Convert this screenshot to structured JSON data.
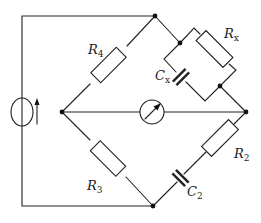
{
  "diagram": {
    "type": "ac-bridge-circuit",
    "components": [
      {
        "id": "R4",
        "kind": "resistor",
        "label": "R",
        "subscript": "4",
        "branch": "left-node to top-node"
      },
      {
        "id": "Rx",
        "kind": "resistor",
        "label": "R",
        "subscript": "x",
        "branch": "top-node to right-node (parallel with Cx)"
      },
      {
        "id": "Cx",
        "kind": "capacitor",
        "label": "C",
        "subscript": "x",
        "branch": "top-node to right-node (parallel with Rx)"
      },
      {
        "id": "R3",
        "kind": "resistor",
        "label": "R",
        "subscript": "3",
        "branch": "left-node to bottom-node"
      },
      {
        "id": "R2",
        "kind": "resistor",
        "label": "R",
        "subscript": "2",
        "branch": "right-node to bottom-node (series with C2)"
      },
      {
        "id": "C2",
        "kind": "capacitor",
        "label": "C",
        "subscript": "2",
        "branch": "right-node to bottom-node (series with R2)"
      },
      {
        "id": "G",
        "kind": "galvanometer",
        "label": "",
        "branch": "left-node to right-node"
      },
      {
        "id": "S",
        "kind": "ac-current-source",
        "label": "",
        "icon": "arrow-up-icon",
        "branch": "top-node to bottom-node via left rail"
      }
    ],
    "nodes": [
      "top",
      "left",
      "right",
      "bottom",
      "rx-cx-split",
      "rx-cx-join"
    ]
  }
}
